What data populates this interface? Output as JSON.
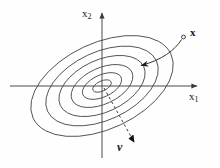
{
  "figure": {
    "background_color": "#fefefe",
    "stroke_color": "#3a3a3a",
    "axis_color": "#4a4a4a",
    "label_color": "#1a1a1a"
  },
  "axes": {
    "x_axis": {
      "label": "x",
      "subscript": "1",
      "origin_x": 102,
      "origin_y": 86,
      "start_x": 10,
      "end_x": 201,
      "arrow": "right"
    },
    "y_axis": {
      "label": "x",
      "subscript": "2",
      "origin_x": 102,
      "origin_y": 86,
      "start_y": 158,
      "end_y": 9,
      "arrow": "up"
    }
  },
  "annotations": {
    "point_x": {
      "label": "x",
      "marker": "small-circle",
      "marker_x": 183,
      "marker_y": 37,
      "label_x": 190,
      "label_y": 27
    },
    "vector_v": {
      "label": "v",
      "style": "dashed",
      "from_x": 102,
      "from_y": 86,
      "to_x": 137,
      "to_y": 146,
      "arrow": "arrowhead"
    },
    "curved_arrow": {
      "description": "curved arrow from point x toward the contour center",
      "from_x": 181,
      "from_y": 40,
      "to_x": 137,
      "to_y": 65
    }
  },
  "chart_data": {
    "type": "contour",
    "title": "",
    "xlabel": "x1",
    "ylabel": "x2",
    "center": [
      102,
      86
    ],
    "rotation_deg": -25,
    "n_contours": 6,
    "contours": [
      {
        "level": 1,
        "rx": 10,
        "ry": 5
      },
      {
        "level": 2,
        "rx": 21,
        "ry": 11
      },
      {
        "level": 3,
        "rx": 33,
        "ry": 18
      },
      {
        "level": 4,
        "rx": 46,
        "ry": 26
      },
      {
        "level": 5,
        "rx": 60,
        "ry": 34
      },
      {
        "level": 6,
        "rx": 76,
        "ry": 43
      }
    ],
    "grid": false,
    "legend": null
  }
}
